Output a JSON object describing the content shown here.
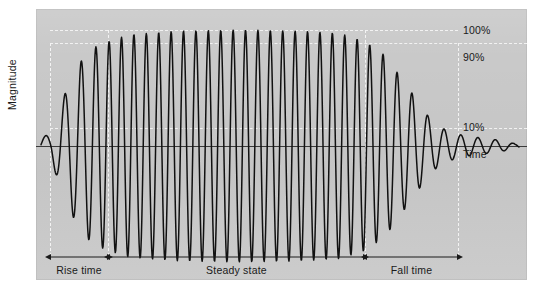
{
  "figure": {
    "title": "",
    "panel_color": "#c9c9c9",
    "background_color": "#ffffff",
    "wave_color": "#111111",
    "axis_color": "#3a3a3a",
    "guide_color": "#f2f2f2"
  },
  "axes": {
    "y_axis_label": "Magnitude",
    "x_axis_label": "Time"
  },
  "y_markers": [
    {
      "name": "level-100",
      "label": "100%",
      "value": 100,
      "y_px": 30
    },
    {
      "name": "level-90",
      "label": "90%",
      "value": 90,
      "y_px": 43
    },
    {
      "name": "level-10",
      "label": "10%",
      "value": 10,
      "y_px": 128
    },
    {
      "name": "time-axis",
      "label": "Time",
      "value": 0,
      "y_px": 146
    }
  ],
  "regions": [
    {
      "name": "rise-time",
      "label": "Rise time",
      "x_start_px": 50,
      "x_end_px": 108
    },
    {
      "name": "steady-state",
      "label": "Steady state",
      "x_start_px": 108,
      "x_end_px": 365
    },
    {
      "name": "fall-time",
      "label": "Fall time",
      "x_start_px": 365,
      "x_end_px": 458
    }
  ],
  "chart_data": {
    "type": "line",
    "title": "",
    "subtitle": "",
    "xlabel": "Time",
    "ylabel": "Magnitude",
    "xlim": [
      0,
      1
    ],
    "ylim": [
      -110,
      110
    ],
    "grid": false,
    "legend": null,
    "annotations": [
      {
        "text": "100%",
        "type": "level",
        "value": 100
      },
      {
        "text": "90%",
        "type": "level",
        "value": 90
      },
      {
        "text": "10%",
        "type": "level",
        "value": 10
      },
      {
        "text": "Time",
        "type": "axis"
      },
      {
        "text": "Magnitude",
        "type": "axis"
      },
      {
        "text": "Rise time",
        "type": "span"
      },
      {
        "text": "Steady state",
        "type": "span"
      },
      {
        "text": "Fall time",
        "type": "span"
      }
    ],
    "series": [
      {
        "name": "tone burst envelope",
        "envelope_keypoints_pct": [
          {
            "x_px": 42,
            "amplitude_pct": 8
          },
          {
            "x_px": 50,
            "amplitude_pct": 10
          },
          {
            "x_px": 60,
            "amplitude_pct": 34
          },
          {
            "x_px": 70,
            "amplitude_pct": 56
          },
          {
            "x_px": 80,
            "amplitude_pct": 72
          },
          {
            "x_px": 92,
            "amplitude_pct": 84
          },
          {
            "x_px": 108,
            "amplitude_pct": 90
          },
          {
            "x_px": 130,
            "amplitude_pct": 96
          },
          {
            "x_px": 180,
            "amplitude_pct": 99
          },
          {
            "x_px": 240,
            "amplitude_pct": 100
          },
          {
            "x_px": 300,
            "amplitude_pct": 99
          },
          {
            "x_px": 340,
            "amplitude_pct": 97
          },
          {
            "x_px": 365,
            "amplitude_pct": 90
          },
          {
            "x_px": 385,
            "amplitude_pct": 78
          },
          {
            "x_px": 400,
            "amplitude_pct": 60
          },
          {
            "x_px": 415,
            "amplitude_pct": 42
          },
          {
            "x_px": 428,
            "amplitude_pct": 26
          },
          {
            "x_px": 440,
            "amplitude_pct": 16
          },
          {
            "x_px": 458,
            "amplitude_pct": 10
          },
          {
            "x_px": 480,
            "amplitude_pct": 7
          },
          {
            "x_px": 500,
            "amplitude_pct": 5
          },
          {
            "x_px": 515,
            "amplitude_pct": 2
          }
        ],
        "cycles_total": 40
      }
    ]
  }
}
